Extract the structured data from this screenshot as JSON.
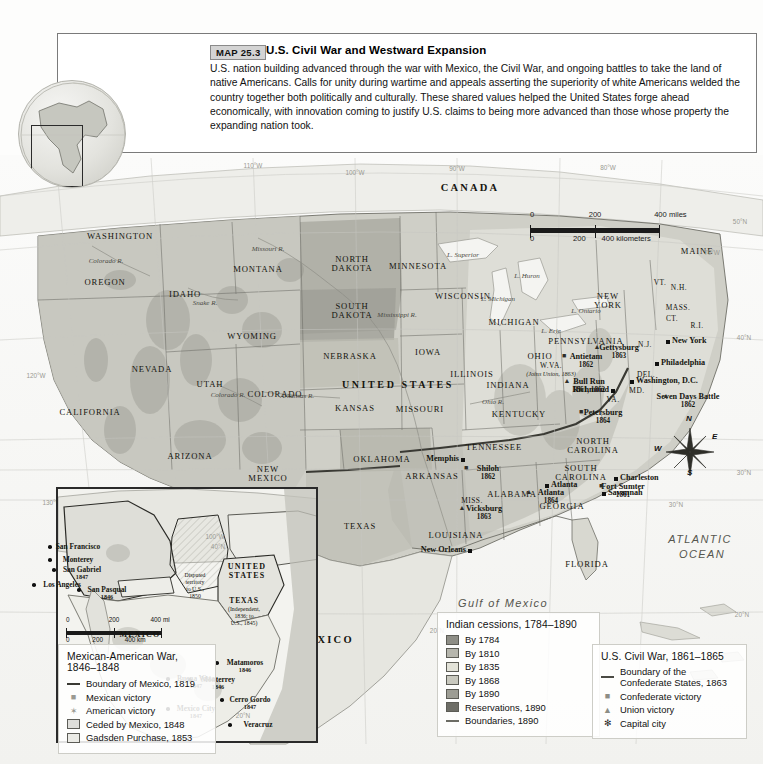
{
  "caption": {
    "map_number": "MAP 25.3",
    "title": "U.S. Civil War and Westward Expansion",
    "body": "U.S. nation building advanced through the war with Mexico, the Civil War, and ongoing battles to take the land of native Americans. Calls for unity during wartime and appeals asserting the superiority of white Americans welded the country together both politically and culturally. These shared values helped the United States forge ahead economically, with innovation coming to justify U.S. claims to being more advanced than those whose property the expanding nation took."
  },
  "legend_cessions": {
    "title": "Indian cessions, 1784–1890",
    "items": [
      {
        "label": "By 1784",
        "color": "#8e8e86",
        "type": "swatch"
      },
      {
        "label": "By 1810",
        "color": "#b6b6ad",
        "type": "swatch"
      },
      {
        "label": "By 1835",
        "color": "#e2e2d8",
        "type": "swatch"
      },
      {
        "label": "By 1868",
        "color": "#c9c9bf",
        "type": "swatch"
      },
      {
        "label": "By 1890",
        "color": "#9d9d94",
        "type": "swatch"
      },
      {
        "label": "Reservations, 1890",
        "color": "#6d6d66",
        "type": "swatch"
      },
      {
        "label": "Boundaries, 1890",
        "color": "#6b6b64",
        "type": "line"
      }
    ]
  },
  "legend_civilwar": {
    "title": "U.S. Civil War, 1861–1865",
    "items": [
      {
        "label": "Boundary of the Confederate States, 1863",
        "type": "line",
        "color": "#4a4a44"
      },
      {
        "label": "Confederate victory",
        "type": "symbol",
        "glyph": "■",
        "color": "#8d8d85"
      },
      {
        "label": "Union victory",
        "type": "symbol",
        "glyph": "▲",
        "color": "#8d8d85"
      },
      {
        "label": "Capital city",
        "type": "symbol",
        "glyph": "✻",
        "color": "#222"
      }
    ]
  },
  "legend_mexwar": {
    "title": "Mexican-American War, 1846–1848",
    "items": [
      {
        "label": "Boundary of Mexico, 1819",
        "type": "line",
        "color": "#3a3a34"
      },
      {
        "label": "Mexican victory",
        "type": "symbol",
        "glyph": "■",
        "color": "#9a9a92"
      },
      {
        "label": "American victory",
        "type": "symbol",
        "glyph": "✶",
        "color": "#9a9a92"
      },
      {
        "label": "Ceded by Mexico, 1848",
        "type": "swatch",
        "color": "#dededa"
      },
      {
        "label": "Gadsden Purchase, 1853",
        "type": "swatch",
        "color": "#ebebe6"
      }
    ]
  },
  "scale_main": {
    "miles": {
      "ticks": [
        "0",
        "200",
        "400 miles"
      ]
    },
    "kilometers": {
      "ticks": [
        "0",
        "200",
        "400 kilometers"
      ]
    }
  },
  "scale_inset": {
    "miles": {
      "ticks": [
        "0",
        "200",
        "400 mi"
      ]
    },
    "kilometers": {
      "ticks": [
        "0",
        "200",
        "400 km"
      ]
    }
  },
  "compass": {
    "n": "N",
    "e": "E",
    "s": "S",
    "w": "W"
  },
  "countries": [
    {
      "name": "CANADA",
      "x": 470,
      "y": 182
    },
    {
      "name": "UNITED STATES",
      "x": 398,
      "y": 380
    },
    {
      "name": "MEXICO",
      "x": 325,
      "y": 634
    }
  ],
  "oceans": [
    {
      "name": "ATLANTIC",
      "x": 700,
      "y": 534
    },
    {
      "name": "OCEAN",
      "x": 702,
      "y": 549
    },
    {
      "name": "Gulf of Mexico",
      "x": 503,
      "y": 598
    }
  ],
  "waters": [
    {
      "name": "Missouri R.",
      "x": 268,
      "y": 246
    },
    {
      "name": "Snake R.",
      "x": 205,
      "y": 300
    },
    {
      "name": "Colorado R.",
      "x": 106,
      "y": 258
    },
    {
      "name": "Colorado R.",
      "x": 228,
      "y": 392
    },
    {
      "name": "Arkansas R.",
      "x": 297,
      "y": 393
    },
    {
      "name": "Mississippi R.",
      "x": 397,
      "y": 312
    },
    {
      "name": "Ohio R.",
      "x": 493,
      "y": 399
    },
    {
      "name": "L. Superior",
      "x": 463,
      "y": 252
    },
    {
      "name": "L. Michigan",
      "x": 498,
      "y": 296
    },
    {
      "name": "L. Huron",
      "x": 527,
      "y": 273
    },
    {
      "name": "L. Erie",
      "x": 551,
      "y": 328
    },
    {
      "name": "L. Ontario",
      "x": 586,
      "y": 308
    }
  ],
  "states": [
    {
      "name": "WASHINGTON",
      "x": 120,
      "y": 232
    },
    {
      "name": "OREGON",
      "x": 105,
      "y": 278
    },
    {
      "name": "IDAHO",
      "x": 185,
      "y": 290
    },
    {
      "name": "MONTANA",
      "x": 258,
      "y": 265
    },
    {
      "name": "NORTH DAKOTA",
      "x": 352,
      "y": 255
    },
    {
      "name": "MINNESOTA",
      "x": 418,
      "y": 262
    },
    {
      "name": "WISCONSIN",
      "x": 463,
      "y": 292
    },
    {
      "name": "MICHIGAN",
      "x": 514,
      "y": 318
    },
    {
      "name": "SOUTH DAKOTA",
      "x": 352,
      "y": 302
    },
    {
      "name": "WYOMING",
      "x": 252,
      "y": 332
    },
    {
      "name": "NEVADA",
      "x": 152,
      "y": 365
    },
    {
      "name": "UTAH",
      "x": 210,
      "y": 380
    },
    {
      "name": "COLORADO",
      "x": 275,
      "y": 390
    },
    {
      "name": "NEBRASKA",
      "x": 350,
      "y": 352
    },
    {
      "name": "IOWA",
      "x": 428,
      "y": 348
    },
    {
      "name": "ILLINOIS",
      "x": 472,
      "y": 370
    },
    {
      "name": "KANSAS",
      "x": 355,
      "y": 404
    },
    {
      "name": "MISSOURI",
      "x": 420,
      "y": 405
    },
    {
      "name": "INDIANA",
      "x": 508,
      "y": 381
    },
    {
      "name": "OHIO",
      "x": 540,
      "y": 352
    },
    {
      "name": "CALIFORNIA",
      "x": 90,
      "y": 408
    },
    {
      "name": "ARIZONA",
      "x": 190,
      "y": 452
    },
    {
      "name": "NEW MEXICO",
      "x": 268,
      "y": 465
    },
    {
      "name": "OKLAHOMA",
      "x": 382,
      "y": 455
    },
    {
      "name": "ARKANSAS",
      "x": 432,
      "y": 472
    },
    {
      "name": "TENNESSEE",
      "x": 494,
      "y": 443
    },
    {
      "name": "KENTUCKY",
      "x": 519,
      "y": 410
    },
    {
      "name": "TEXAS",
      "x": 360,
      "y": 522
    },
    {
      "name": "LOUISIANA",
      "x": 456,
      "y": 531
    },
    {
      "name": "ALABAMA",
      "x": 512,
      "y": 490
    },
    {
      "name": "GEORGIA",
      "x": 562,
      "y": 502
    },
    {
      "name": "FLORIDA",
      "x": 587,
      "y": 560
    },
    {
      "name": "PENNSYLVANIA",
      "x": 586,
      "y": 337
    },
    {
      "name": "NEW YORK",
      "x": 608,
      "y": 292
    },
    {
      "name": "MAINE",
      "x": 697,
      "y": 247
    },
    {
      "name": "NORTH CAROLINA",
      "x": 593,
      "y": 437
    },
    {
      "name": "SOUTH CAROLINA",
      "x": 581,
      "y": 464
    }
  ],
  "states_small": [
    {
      "name": "MISS.",
      "x": 472,
      "y": 497
    },
    {
      "name": "VT.",
      "x": 660,
      "y": 279
    },
    {
      "name": "N.H.",
      "x": 679,
      "y": 284
    },
    {
      "name": "MASS.",
      "x": 678,
      "y": 304
    },
    {
      "name": "CT.",
      "x": 672,
      "y": 315
    },
    {
      "name": "R.I.",
      "x": 697,
      "y": 322
    },
    {
      "name": "N.J.",
      "x": 645,
      "y": 341
    },
    {
      "name": "DEL.",
      "x": 646,
      "y": 371
    },
    {
      "name": "MD.",
      "x": 637,
      "y": 387
    },
    {
      "name": "VA.",
      "x": 613,
      "y": 396
    },
    {
      "name": "W.VA.",
      "x": 551,
      "y": 362
    }
  ],
  "notes": [
    {
      "text": "(Joins Union, 1863)",
      "x": 551,
      "y": 371
    }
  ],
  "cities": [
    {
      "name": "New York",
      "x": 672,
      "y": 337,
      "anchor": "left"
    },
    {
      "name": "Philadelphia",
      "x": 661,
      "y": 359,
      "anchor": "left"
    },
    {
      "name": "Washington, D.C.",
      "x": 636,
      "y": 377,
      "anchor": "left"
    },
    {
      "name": "Richmond",
      "x": 609,
      "y": 386,
      "anchor": "right"
    },
    {
      "name": "Memphis",
      "x": 459,
      "y": 455,
      "anchor": "right"
    },
    {
      "name": "Charleston",
      "x": 620,
      "y": 474,
      "anchor": "left"
    },
    {
      "name": "Savannah",
      "x": 608,
      "y": 489,
      "anchor": "left"
    },
    {
      "name": "New Orleans",
      "x": 466,
      "y": 546,
      "anchor": "right"
    },
    {
      "name": "Atlanta",
      "x": 551,
      "y": 481,
      "anchor": "left"
    }
  ],
  "battles": [
    {
      "name": "Gettysburg",
      "year": "1863",
      "x": 619,
      "y": 344
    },
    {
      "name": "Antietam",
      "year": "1862",
      "x": 586,
      "y": 353
    },
    {
      "name": "Bull Run",
      "year": "1861, 1862",
      "x": 589,
      "y": 378
    },
    {
      "name": "Petersburg",
      "year": "1864",
      "x": 603,
      "y": 409
    },
    {
      "name": "Seven Days Battle",
      "year": "1862",
      "x": 688,
      "y": 393
    },
    {
      "name": "Shiloh",
      "year": "1862",
      "x": 488,
      "y": 465
    },
    {
      "name": "Vicksburg",
      "year": "1863",
      "x": 484,
      "y": 505
    },
    {
      "name": "Fort Sumter",
      "year": "1861",
      "x": 623,
      "y": 483
    },
    {
      "name": "Atlanta",
      "year": "1864",
      "x": 551,
      "y": 489
    }
  ],
  "grid_labels": [
    {
      "text": "110°W",
      "x": 253,
      "y": 163
    },
    {
      "text": "100°W",
      "x": 355,
      "y": 170
    },
    {
      "text": "90°W",
      "x": 457,
      "y": 166
    },
    {
      "text": "80°W",
      "x": 608,
      "y": 165
    },
    {
      "text": "70°W",
      "x": 712,
      "y": 250
    },
    {
      "text": "120°W",
      "x": 36,
      "y": 373
    },
    {
      "text": "130°W",
      "x": 52,
      "y": 500
    },
    {
      "text": "50°N",
      "x": 740,
      "y": 219
    },
    {
      "text": "40°N",
      "x": 744,
      "y": 335
    },
    {
      "text": "30°N",
      "x": 744,
      "y": 470
    },
    {
      "text": "30°N",
      "x": 676,
      "y": 502
    },
    {
      "text": "20°N",
      "x": 437,
      "y": 628
    },
    {
      "text": "20°N",
      "x": 742,
      "y": 612
    }
  ],
  "inset": {
    "countries": [
      {
        "name": "UNITED STATES",
        "x": 247,
        "y": 563
      },
      {
        "name": "MEXICO",
        "x": 140,
        "y": 631
      }
    ],
    "territories": [
      {
        "name": "TEXAS",
        "x": 244,
        "y": 597
      },
      {
        "name": "(Independent,",
        "x": 244,
        "y": 606
      },
      {
        "name": "1836; to",
        "x": 244,
        "y": 613
      },
      {
        "name": "U.S., 1845)",
        "x": 244,
        "y": 620
      },
      {
        "name": "Disputed",
        "x": 195,
        "y": 572
      },
      {
        "name": "territory",
        "x": 195,
        "y": 579
      },
      {
        "name": "to U.S.,",
        "x": 195,
        "y": 586
      },
      {
        "name": "1850",
        "x": 195,
        "y": 593
      }
    ],
    "cities": [
      {
        "name": "San Francisco",
        "year": "",
        "x": 78,
        "y": 543
      },
      {
        "name": "Monterey",
        "year": "",
        "x": 78,
        "y": 556
      },
      {
        "name": "San Gabriel",
        "year": "1847",
        "x": 82,
        "y": 566
      },
      {
        "name": "Los Angeles",
        "year": "",
        "x": 62,
        "y": 581
      },
      {
        "name": "San Pasqual",
        "year": "1846",
        "x": 107,
        "y": 586
      },
      {
        "name": "Monterrey",
        "year": "1846",
        "x": 218,
        "y": 676
      },
      {
        "name": "Matamoros",
        "year": "1846",
        "x": 245,
        "y": 659
      },
      {
        "name": "Buena Vista",
        "year": "1847",
        "x": 196,
        "y": 675
      },
      {
        "name": "Cerro Gordo",
        "year": "1847",
        "x": 250,
        "y": 696
      },
      {
        "name": "Mexico City",
        "year": "1847",
        "x": 196,
        "y": 705
      },
      {
        "name": "Veracruz",
        "year": "",
        "x": 258,
        "y": 721
      }
    ],
    "grid_labels": [
      {
        "text": "100°W",
        "x": 215,
        "y": 534
      },
      {
        "text": "40°N",
        "x": 218,
        "y": 544
      },
      {
        "text": "20°N",
        "x": 243,
        "y": 713
      }
    ]
  }
}
